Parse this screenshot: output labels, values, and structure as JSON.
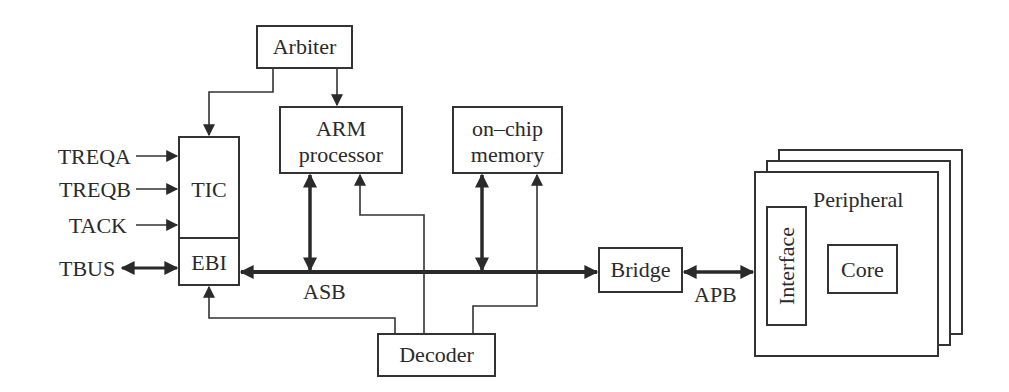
{
  "diagram": {
    "blocks": {
      "arbiter": "Arbiter",
      "arm_line1": "ARM",
      "arm_line2": "processor",
      "memory_line1": "on–chip",
      "memory_line2": "memory",
      "tic": "TIC",
      "ebi": "EBI",
      "bridge": "Bridge",
      "decoder": "Decoder",
      "peripheral": "Peripheral",
      "interface": "Interface",
      "core": "Core"
    },
    "signals": {
      "treqa": "TREQA",
      "treqb": "TREQB",
      "tack": "TACK",
      "tbus": "TBUS"
    },
    "buses": {
      "asb": "ASB",
      "apb": "APB"
    }
  }
}
